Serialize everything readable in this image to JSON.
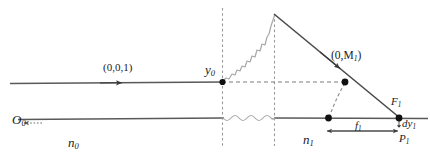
{
  "figure": {
    "colors": {
      "axis": "#555555",
      "ray": "#4a4a4a",
      "dashed": "#8a8a8a",
      "wavy": "#9a9a9a",
      "dot": "#111111",
      "text": "#1a1a1a",
      "background": "#ffffff"
    }
  },
  "labels": {
    "direction_vector": "(0,0,1)",
    "object_height": "y",
    "object_height_sub": "0",
    "vertex_point": "O",
    "vertex_point_sub": "0",
    "index_left": "n",
    "index_left_sub": "0",
    "index_right": "n",
    "index_right_sub": "1",
    "ray_point": "(0,M",
    "ray_point_sub": "1",
    "ray_point_close": ")",
    "focal_point": "F",
    "focal_point_sub": "1",
    "focal_length": "f",
    "focal_length_sub": "1",
    "image_point": "P",
    "image_point_sub": "1",
    "differential": "dy",
    "differential_sub": "1"
  },
  "geometry": {
    "upper_axis_y": 82,
    "lower_axis_y": 118,
    "plane_one_x": 222,
    "plane_two_x": 274,
    "apex_y": 14,
    "focal_x": 399,
    "image_x": 328,
    "ray_point_x": 345,
    "ray_point_y": 82
  }
}
